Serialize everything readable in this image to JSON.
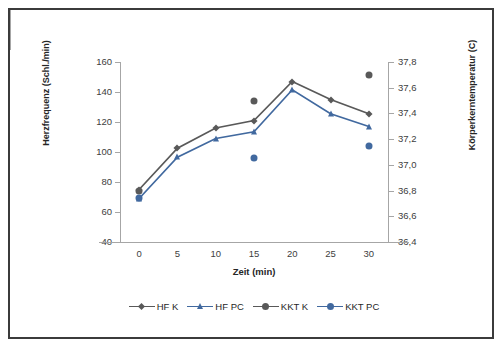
{
  "chart_data": {
    "type": "line",
    "title": "",
    "xlabel": "Zeit (min)",
    "ylabel": "Herzfrequenz (Schl./min)",
    "ylabel_secondary": "Körperkerntemperatur (C)",
    "x": [
      0,
      5,
      10,
      15,
      20,
      25,
      30
    ],
    "xticklabels": [
      "0",
      "5",
      "10",
      "15",
      "20",
      "25",
      "30"
    ],
    "xlim": [
      -2.5,
      32.5
    ],
    "ylim": [
      40,
      160
    ],
    "yticklabels": [
      "40",
      "60",
      "80",
      "100",
      "120",
      "140",
      "160"
    ],
    "yticks": [
      40,
      60,
      80,
      100,
      120,
      140,
      160
    ],
    "ylim_secondary": [
      36.4,
      37.8
    ],
    "yticklabels_secondary": [
      "36,4",
      "36,6",
      "36,8",
      "37,0",
      "37,2",
      "37,4",
      "37,6",
      "37,8"
    ],
    "yticks_secondary": [
      36.4,
      36.6,
      36.8,
      37.0,
      37.2,
      37.4,
      37.6,
      37.8
    ],
    "grid": false,
    "legend_position": "bottom",
    "series": [
      {
        "name": "HF K",
        "axis": "left",
        "marker": "diamond",
        "color": "#595959",
        "line": true,
        "x": [
          0,
          5,
          10,
          15,
          20,
          25,
          30
        ],
        "values": [
          75,
          102.5,
          116,
          121,
          147,
          135,
          125.5
        ]
      },
      {
        "name": "HF PC",
        "axis": "left",
        "marker": "triangle",
        "color": "#41699f",
        "line": true,
        "x": [
          0,
          5,
          10,
          15,
          20,
          25,
          30
        ],
        "values": [
          69,
          96.5,
          109,
          113.5,
          141.5,
          125.5,
          117
        ]
      },
      {
        "name": "KKT K",
        "axis": "right",
        "marker": "circle",
        "color": "#595959",
        "line": false,
        "x": [
          0,
          15,
          30
        ],
        "values": [
          36.8,
          37.5,
          37.7
        ]
      },
      {
        "name": "KKT PC",
        "axis": "right",
        "marker": "circle",
        "color": "#41699f",
        "line": false,
        "x": [
          0,
          15,
          30
        ],
        "values": [
          36.74,
          37.05,
          37.15
        ]
      }
    ]
  },
  "legend": {
    "items": [
      {
        "label": "HF K"
      },
      {
        "label": "HF PC"
      },
      {
        "label": "KKT K"
      },
      {
        "label": "KKT PC"
      }
    ]
  },
  "colors": {
    "gray_series": "#595959",
    "blue_series": "#41699f",
    "axis": "#a6a6a6",
    "text": "#404040",
    "frame": "#3b3b3b"
  }
}
